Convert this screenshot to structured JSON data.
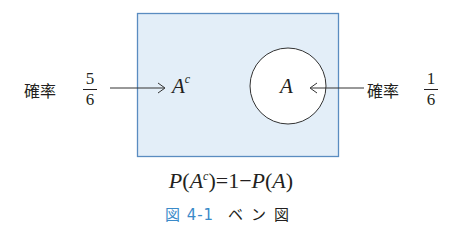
{
  "diagram": {
    "type": "venn",
    "universe": {
      "fill": "#e3eef8",
      "stroke": "#5a8cc0"
    },
    "set_a": {
      "label": "A",
      "fill": "#ffffff",
      "stroke": "#333333"
    },
    "complement_label": "A",
    "complement_sup": "c",
    "left": {
      "label": "確率",
      "numerator": "5",
      "denominator": "6"
    },
    "right": {
      "label": "確率",
      "numerator": "1",
      "denominator": "6"
    }
  },
  "formula": {
    "p1": "P",
    "open1": "(",
    "a1": "A",
    "sup": "c",
    "close1": ")",
    "eq": "=1−",
    "p2": "P",
    "open2": "(",
    "a2": "A",
    "close2": ")"
  },
  "caption": {
    "number": "図 4-1",
    "title": "ベン図",
    "accent_color": "#3a8ac9"
  }
}
